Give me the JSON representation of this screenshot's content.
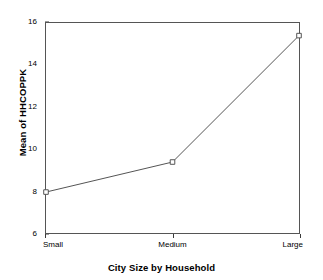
{
  "chart_data": {
    "type": "line",
    "title": "",
    "subtitle": "",
    "xlabel": "City Size by Household",
    "ylabel": "Mean of HHCOPPK",
    "categories": [
      "Small",
      "Medium",
      "Large"
    ],
    "values": [
      7.95,
      9.38,
      15.4
    ],
    "series": [
      {
        "name": "Mean of HHCOPPK",
        "values": [
          7.95,
          9.38,
          15.4
        ]
      }
    ],
    "ylim": [
      6,
      16
    ],
    "yticks": [
      6,
      8,
      10,
      12,
      14,
      16
    ],
    "ytick_labels": [
      "6",
      "8",
      "10",
      "12",
      "14",
      "16"
    ],
    "xtick_labels": [
      "Small",
      "Medium",
      "Large"
    ],
    "grid": false,
    "legend": false,
    "legend_position": "none",
    "marker": "open-square",
    "line_color": "#555555",
    "marker_color": "#555555",
    "background_color": "#ffffff",
    "frame": true,
    "annotations": []
  },
  "axes": {
    "y": {
      "title": "Mean of HHCOPPK",
      "ticks": [
        {
          "label": "16",
          "value": 16
        },
        {
          "label": "14",
          "value": 14
        },
        {
          "label": "12",
          "value": 12
        },
        {
          "label": "10",
          "value": 10
        },
        {
          "label": "8",
          "value": 8
        },
        {
          "label": "6",
          "value": 6
        }
      ]
    },
    "x": {
      "title": "City Size by Household",
      "ticks": [
        {
          "label": "Small",
          "index": 0
        },
        {
          "label": "Medium",
          "index": 1
        },
        {
          "label": "Large",
          "index": 2
        }
      ]
    }
  }
}
